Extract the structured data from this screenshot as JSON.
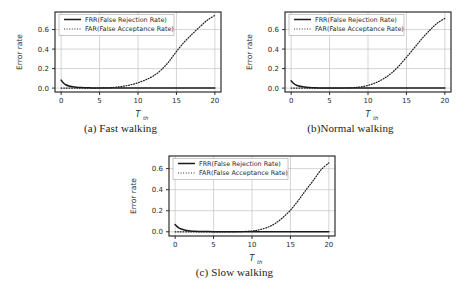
{
  "figure": {
    "panels": [
      {
        "id": "a",
        "caption": "(a) Fast walking",
        "chart_data": {
          "type": "line",
          "title": "",
          "xlabel": "T_th",
          "ylabel": "Error rate",
          "xlim": [
            -0.8,
            20.8
          ],
          "ylim": [
            -0.04,
            0.78
          ],
          "xticks": [
            0,
            5,
            10,
            15,
            20
          ],
          "yticks": [
            0.0,
            0.2,
            0.4,
            0.6
          ],
          "xticklabels": [
            "0",
            "5",
            "10",
            "15",
            "20"
          ],
          "yticklabels": [
            "0.0",
            "0.2",
            "0.4",
            "0.6"
          ],
          "grid": true,
          "legend_position": "upper left",
          "series": [
            {
              "name": "FRR(False Rejection Rate)",
              "style": "solid",
              "x": [
                0,
                0.3,
                0.6,
                1.0,
                1.5,
                2.0,
                2.5,
                3.0,
                4.0,
                5.0,
                7.0,
                10.0,
                13.0,
                16.0,
                18.0,
                20.0
              ],
              "values": [
                0.082,
                0.052,
                0.034,
                0.022,
                0.014,
                0.009,
                0.006,
                0.004,
                0.002,
                0.001,
                0.0,
                0.0,
                0.0,
                0.0,
                0.0,
                0.0
              ]
            },
            {
              "name": "FAR(False Acceptance Rate)",
              "style": "dotted",
              "x": [
                0,
                2,
                4,
                6,
                7,
                8,
                9,
                10,
                11,
                12,
                13,
                14,
                15,
                16,
                17,
                18,
                19,
                20
              ],
              "values": [
                0.0,
                0.0,
                0.0,
                0.003,
                0.008,
                0.018,
                0.033,
                0.055,
                0.085,
                0.125,
                0.185,
                0.27,
                0.375,
                0.47,
                0.55,
                0.625,
                0.695,
                0.745
              ]
            }
          ]
        }
      },
      {
        "id": "b",
        "caption": "(b)Normal walking",
        "chart_data": {
          "type": "line",
          "title": "",
          "xlabel": "T_th",
          "ylabel": "Error rate",
          "xlim": [
            -0.8,
            20.8
          ],
          "ylim": [
            -0.04,
            0.78
          ],
          "xticks": [
            0,
            5,
            10,
            15,
            20
          ],
          "yticks": [
            0.0,
            0.2,
            0.4,
            0.6
          ],
          "xticklabels": [
            "0",
            "5",
            "10",
            "15",
            "20"
          ],
          "yticklabels": [
            "0.0",
            "0.2",
            "0.4",
            "0.6"
          ],
          "grid": true,
          "legend_position": "upper left",
          "series": [
            {
              "name": "FRR(False Rejection Rate)",
              "style": "solid",
              "x": [
                0,
                0.3,
                0.6,
                1.0,
                1.5,
                2.0,
                2.5,
                3.0,
                4.0,
                5.0,
                7.0,
                10.0,
                13.0,
                16.0,
                18.0,
                20.0
              ],
              "values": [
                0.075,
                0.05,
                0.033,
                0.021,
                0.013,
                0.008,
                0.005,
                0.003,
                0.002,
                0.001,
                0.0,
                0.0,
                0.0,
                0.0,
                0.0,
                0.0
              ]
            },
            {
              "name": "FAR(False Acceptance Rate)",
              "style": "dotted",
              "x": [
                0,
                2,
                4,
                6,
                8,
                9,
                10,
                11,
                12,
                13,
                14,
                15,
                16,
                17,
                18,
                19,
                20
              ],
              "values": [
                0.0,
                0.0,
                0.0,
                0.0,
                0.004,
                0.012,
                0.028,
                0.055,
                0.095,
                0.15,
                0.225,
                0.315,
                0.41,
                0.505,
                0.59,
                0.665,
                0.715
              ]
            }
          ]
        }
      },
      {
        "id": "c",
        "caption": "(c) Slow walking",
        "chart_data": {
          "type": "line",
          "title": "",
          "xlabel": "T_th",
          "ylabel": "Error rate",
          "xlim": [
            -0.8,
            20.8
          ],
          "ylim": [
            -0.04,
            0.72
          ],
          "xticks": [
            0,
            5,
            10,
            15,
            20
          ],
          "yticks": [
            0.0,
            0.2,
            0.4,
            0.6
          ],
          "xticklabels": [
            "0",
            "5",
            "10",
            "15",
            "20"
          ],
          "yticklabels": [
            "0.0",
            "0.2",
            "0.4",
            "0.6"
          ],
          "grid": true,
          "legend_position": "upper left",
          "series": [
            {
              "name": "FRR(False Rejection Rate)",
              "style": "solid",
              "x": [
                0,
                0.3,
                0.6,
                1.0,
                1.5,
                2.0,
                2.5,
                3.0,
                4.0,
                5.0,
                7.0,
                10.0,
                13.0,
                16.0,
                18.0,
                20.0
              ],
              "values": [
                0.068,
                0.047,
                0.032,
                0.021,
                0.013,
                0.008,
                0.005,
                0.003,
                0.002,
                0.001,
                0.0,
                0.0,
                0.0,
                0.0,
                0.0,
                0.0
              ]
            },
            {
              "name": "FAR(False Acceptance Rate)",
              "style": "dotted",
              "x": [
                0,
                2,
                4,
                6,
                8,
                10,
                11,
                12,
                13,
                14,
                15,
                16,
                17,
                18,
                19,
                20
              ],
              "values": [
                0.0,
                0.0,
                0.0,
                0.0,
                0.0,
                0.008,
                0.02,
                0.042,
                0.078,
                0.135,
                0.205,
                0.295,
                0.395,
                0.49,
                0.59,
                0.655
              ]
            }
          ]
        }
      }
    ],
    "axis_label_main": "T",
    "axis_label_sub": "th",
    "colors": {
      "line": "#1a1a1a",
      "grid": "#b9b9b9",
      "frame": "#1a1a1a",
      "text": "#2a2a2a",
      "background": "#ffffff"
    }
  }
}
